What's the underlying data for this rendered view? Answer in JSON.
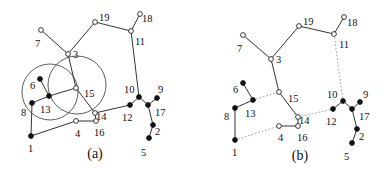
{
  "panels": [
    {
      "id": "a",
      "caption": "(a)",
      "caption_pos": [
        95,
        158
      ],
      "circles": [
        {
          "cx": 50,
          "cy": 92,
          "r": 28
        },
        {
          "cx": 77,
          "cy": 85,
          "r": 29
        }
      ],
      "nodes": [
        {
          "id": "1",
          "x": 31,
          "y": 136,
          "type": "solid",
          "lx": 28,
          "ly": 152
        },
        {
          "id": "2",
          "x": 153,
          "y": 125,
          "type": "solid",
          "lx": 155,
          "ly": 135
        },
        {
          "id": "3",
          "x": 68,
          "y": 54,
          "type": "open",
          "lx": 73,
          "ly": 58
        },
        {
          "id": "4",
          "x": 76,
          "y": 121,
          "type": "open",
          "lx": 75,
          "ly": 137
        },
        {
          "id": "5",
          "x": 149,
          "y": 138,
          "type": "solid",
          "lx": 141,
          "ly": 156
        },
        {
          "id": "6",
          "x": 40,
          "y": 79,
          "type": "solid",
          "lx": 30,
          "ly": 89
        },
        {
          "id": "7",
          "x": 41,
          "y": 30,
          "type": "open",
          "lx": 35,
          "ly": 47
        },
        {
          "id": "8",
          "x": 32,
          "y": 103,
          "type": "solid",
          "lx": 21,
          "ly": 116
        },
        {
          "id": "9",
          "x": 157,
          "y": 98,
          "type": "solid",
          "lx": 158,
          "ly": 93
        },
        {
          "id": "10",
          "x": 139,
          "y": 97,
          "type": "solid",
          "lx": 124,
          "ly": 93
        },
        {
          "id": "11",
          "x": 131,
          "y": 31,
          "type": "open",
          "lx": 135,
          "ly": 45
        },
        {
          "id": "12",
          "x": 130,
          "y": 105,
          "type": "solid",
          "lx": 122,
          "ly": 121
        },
        {
          "id": "13",
          "x": 49,
          "y": 96,
          "type": "solid",
          "lx": 40,
          "ly": 113
        },
        {
          "id": "14",
          "x": 95,
          "y": 113,
          "type": "open",
          "lx": 96,
          "ly": 120
        },
        {
          "id": "15",
          "x": 76,
          "y": 88,
          "type": "open",
          "lx": 84,
          "ly": 97
        },
        {
          "id": "16",
          "x": 96,
          "y": 121,
          "type": "open",
          "lx": 94,
          "ly": 136
        },
        {
          "id": "17",
          "x": 148,
          "y": 105,
          "type": "solid",
          "lx": 155,
          "ly": 116
        },
        {
          "id": "18",
          "x": 140,
          "y": 14,
          "type": "open",
          "lx": 142,
          "ly": 22
        },
        {
          "id": "19",
          "x": 95,
          "y": 22,
          "type": "open",
          "lx": 99,
          "ly": 21
        }
      ],
      "edges": [
        [
          "7",
          "3"
        ],
        [
          "3",
          "19"
        ],
        [
          "19",
          "11"
        ],
        [
          "11",
          "18"
        ],
        [
          "11",
          "10"
        ],
        [
          "3",
          "15"
        ],
        [
          "15",
          "14"
        ],
        [
          "14",
          "16"
        ],
        [
          "16",
          "4"
        ],
        [
          "4",
          "1"
        ],
        [
          "1",
          "8"
        ],
        [
          "8",
          "13"
        ],
        [
          "13",
          "6"
        ],
        [
          "13",
          "15"
        ],
        [
          "14",
          "12"
        ],
        [
          "12",
          "10"
        ],
        [
          "10",
          "17"
        ],
        [
          "17",
          "9"
        ],
        [
          "17",
          "2"
        ],
        [
          "2",
          "5"
        ]
      ],
      "dashed_edges": []
    },
    {
      "id": "b",
      "caption": "(b)",
      "caption_pos": [
        300,
        160
      ],
      "circles": [],
      "nodes": [
        {
          "id": "1",
          "x": 235,
          "y": 140,
          "type": "solid",
          "lx": 232,
          "ly": 156
        },
        {
          "id": "2",
          "x": 357,
          "y": 129,
          "type": "solid",
          "lx": 359,
          "ly": 140
        },
        {
          "id": "3",
          "x": 271,
          "y": 59,
          "type": "open",
          "lx": 276,
          "ly": 63
        },
        {
          "id": "4",
          "x": 279,
          "y": 126,
          "type": "open",
          "lx": 278,
          "ly": 141
        },
        {
          "id": "5",
          "x": 352,
          "y": 143,
          "type": "solid",
          "lx": 344,
          "ly": 160
        },
        {
          "id": "6",
          "x": 243,
          "y": 83,
          "type": "solid",
          "lx": 233,
          "ly": 93
        },
        {
          "id": "7",
          "x": 243,
          "y": 35,
          "type": "open",
          "lx": 237,
          "ly": 52
        },
        {
          "id": "8",
          "x": 235,
          "y": 108,
          "type": "solid",
          "lx": 224,
          "ly": 120
        },
        {
          "id": "9",
          "x": 360,
          "y": 102,
          "type": "solid",
          "lx": 363,
          "ly": 98
        },
        {
          "id": "10",
          "x": 343,
          "y": 101,
          "type": "solid",
          "lx": 327,
          "ly": 98
        },
        {
          "id": "11",
          "x": 334,
          "y": 34,
          "type": "open",
          "lx": 339,
          "ly": 48
        },
        {
          "id": "12",
          "x": 333,
          "y": 109,
          "type": "solid",
          "lx": 326,
          "ly": 125
        },
        {
          "id": "13",
          "x": 253,
          "y": 100,
          "type": "solid",
          "lx": 245,
          "ly": 117
        },
        {
          "id": "14",
          "x": 298,
          "y": 117,
          "type": "open",
          "lx": 299,
          "ly": 124
        },
        {
          "id": "15",
          "x": 279,
          "y": 92,
          "type": "open",
          "lx": 288,
          "ly": 102
        },
        {
          "id": "16",
          "x": 298,
          "y": 126,
          "type": "open",
          "lx": 297,
          "ly": 141
        },
        {
          "id": "17",
          "x": 352,
          "y": 109,
          "type": "solid",
          "lx": 359,
          "ly": 120
        },
        {
          "id": "18",
          "x": 344,
          "y": 17,
          "type": "open",
          "lx": 347,
          "ly": 26
        },
        {
          "id": "19",
          "x": 299,
          "y": 26,
          "type": "open",
          "lx": 303,
          "ly": 25
        }
      ],
      "edges": [
        [
          "7",
          "3"
        ],
        [
          "3",
          "19"
        ],
        [
          "19",
          "11"
        ],
        [
          "11",
          "18"
        ],
        [
          "3",
          "15"
        ],
        [
          "15",
          "14"
        ],
        [
          "14",
          "16"
        ],
        [
          "16",
          "4"
        ],
        [
          "1",
          "8"
        ],
        [
          "8",
          "13"
        ],
        [
          "13",
          "6"
        ],
        [
          "12",
          "10"
        ],
        [
          "10",
          "17"
        ],
        [
          "17",
          "9"
        ],
        [
          "17",
          "2"
        ],
        [
          "2",
          "5"
        ]
      ],
      "dashed_edges": [
        [
          "13",
          "15"
        ],
        [
          "1",
          "4"
        ],
        [
          "14",
          "12"
        ],
        [
          "11",
          "10"
        ]
      ]
    }
  ]
}
